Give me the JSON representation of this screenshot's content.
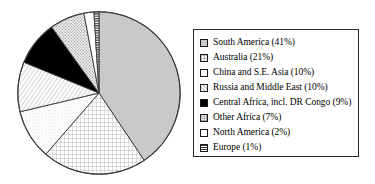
{
  "chart_data": {
    "type": "pie",
    "title": "",
    "subtitle": "",
    "xlabel": "",
    "ylabel": "",
    "grid": false,
    "legend_position": "right",
    "start_angle_deg": 0,
    "direction": "clockwise",
    "categories": [
      "South America",
      "Australia",
      "China and S.E. Asia",
      "Russia and Middle East",
      "Central Africa, incl. DR Congo",
      "Other Africa",
      "North America",
      "Europe"
    ],
    "values": [
      41,
      21,
      10,
      10,
      9,
      7,
      2,
      1
    ],
    "value_unit": "%",
    "slices": [
      {
        "label": "South America",
        "value": 41,
        "legend_text": "South America (41%)",
        "pattern": "solid-gray",
        "color": "#c9c9c9"
      },
      {
        "label": "Australia",
        "value": 21,
        "legend_text": "Australia (21%)",
        "pattern": "grid",
        "color": "#ffffff"
      },
      {
        "label": "China and S.E. Asia",
        "value": 10,
        "legend_text": "China and S.E. Asia (10%)",
        "pattern": "dots-faint",
        "color": "#ffffff"
      },
      {
        "label": "Russia and Middle East",
        "value": 10,
        "legend_text": "Russia and Middle East (10%)",
        "pattern": "diagonal-hatch",
        "color": "#ffffff"
      },
      {
        "label": "Central Africa, incl. DR Congo",
        "value": 9,
        "legend_text": "Central Africa, incl. DR Congo (9%)",
        "pattern": "solid-black",
        "color": "#000000"
      },
      {
        "label": "Other Africa",
        "value": 7,
        "legend_text": "Other Africa (7%)",
        "pattern": "stipple",
        "color": "#f0f0f0"
      },
      {
        "label": "North America",
        "value": 2,
        "legend_text": "North America (2%)",
        "pattern": "white",
        "color": "#ffffff"
      },
      {
        "label": "Europe",
        "value": 1,
        "legend_text": "Europe (1%)",
        "pattern": "horizontal-stripe",
        "color": "#3a3a3a"
      }
    ]
  },
  "legend": {
    "items": [
      {
        "label": "South America (41%)"
      },
      {
        "label": "Australia (21%)"
      },
      {
        "label": "China and S.E. Asia (10%)"
      },
      {
        "label": "Russia and Middle East (10%)"
      },
      {
        "label": "Central Africa, incl. DR Congo (9%)"
      },
      {
        "label": "Other Africa (7%)"
      },
      {
        "label": "North America (2%)"
      },
      {
        "label": "Europe (1%)"
      }
    ]
  }
}
